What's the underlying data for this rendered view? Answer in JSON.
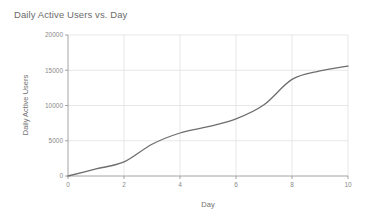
{
  "chart_data": {
    "type": "line",
    "title": "Daily Active Users vs. Day",
    "xlabel": "Day",
    "ylabel": "Daily Active Users",
    "x": [
      0,
      1,
      2,
      3,
      4,
      5,
      6,
      7,
      8,
      9,
      10
    ],
    "values": [
      0,
      1000,
      2000,
      4500,
      6100,
      7000,
      8100,
      10100,
      13700,
      14900,
      15600
    ],
    "series": [
      {
        "name": "Daily Active Users",
        "values": [
          0,
          1000,
          2000,
          4500,
          6100,
          7000,
          8100,
          10100,
          13700,
          14900,
          15600
        ],
        "color": "#6e6e6e"
      }
    ],
    "xlim": [
      0,
      10
    ],
    "ylim": [
      0,
      20000
    ],
    "xticks": [
      0,
      2,
      4,
      6,
      8,
      10
    ],
    "xtick_labels": [
      "0",
      "2",
      "4",
      "6",
      "8",
      "10"
    ],
    "yticks": [
      0,
      5000,
      10000,
      15000,
      20000
    ],
    "ytick_labels": [
      "0",
      "5000",
      "10000",
      "15000",
      "20000"
    ],
    "grid": true,
    "grid_color": "#dedede",
    "legend": false,
    "background": "#ffffff",
    "line_color": "#6e6e6e",
    "line_width": 1.3,
    "axis_color": "#9a9a9a"
  }
}
